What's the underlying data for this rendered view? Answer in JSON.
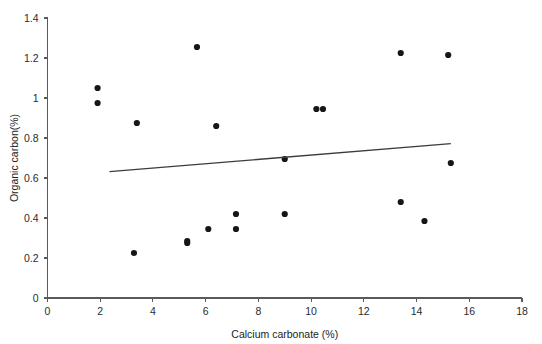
{
  "chart_data": {
    "type": "scatter",
    "title": "",
    "xlabel": "Calcium carbonate (%)",
    "ylabel": "Organic carbon(%)",
    "xlim": [
      0,
      18
    ],
    "ylim": [
      0,
      1.4
    ],
    "xticks": [
      0,
      2,
      4,
      6,
      8,
      10,
      12,
      14,
      16,
      18
    ],
    "xtick_labels": [
      "0",
      "2",
      "4",
      "6",
      "8",
      "10",
      "12",
      "14",
      "16",
      "18"
    ],
    "yticks": [
      0,
      0.2,
      0.4,
      0.6,
      0.8,
      1.0,
      1.2,
      1.4
    ],
    "ytick_labels": [
      "0",
      "0.2",
      "0.4",
      "0.6",
      "0.8",
      "1",
      "1.2",
      "1.4"
    ],
    "grid": false,
    "legend": null,
    "marker": "circle",
    "marker_color": "#161616",
    "marker_size": 3.1,
    "points": [
      {
        "x": 1.9,
        "y": 1.05
      },
      {
        "x": 1.9,
        "y": 0.975
      },
      {
        "x": 3.28,
        "y": 0.225
      },
      {
        "x": 3.39,
        "y": 0.875
      },
      {
        "x": 5.3,
        "y": 0.285
      },
      {
        "x": 5.3,
        "y": 0.275
      },
      {
        "x": 5.67,
        "y": 1.255
      },
      {
        "x": 6.1,
        "y": 0.345
      },
      {
        "x": 6.4,
        "y": 0.86
      },
      {
        "x": 7.15,
        "y": 0.345
      },
      {
        "x": 7.15,
        "y": 0.42
      },
      {
        "x": 9.0,
        "y": 0.695
      },
      {
        "x": 9.0,
        "y": 0.42
      },
      {
        "x": 10.2,
        "y": 0.945
      },
      {
        "x": 10.45,
        "y": 0.945
      },
      {
        "x": 13.4,
        "y": 1.225
      },
      {
        "x": 13.4,
        "y": 0.48
      },
      {
        "x": 14.3,
        "y": 0.385
      },
      {
        "x": 15.2,
        "y": 1.215
      },
      {
        "x": 15.3,
        "y": 0.675
      }
    ],
    "trend_line": {
      "label": "linear fit",
      "x_start": 2.35,
      "y_start": 0.632,
      "x_end": 15.3,
      "y_end": 0.772,
      "color": "#3c3c3c"
    }
  }
}
